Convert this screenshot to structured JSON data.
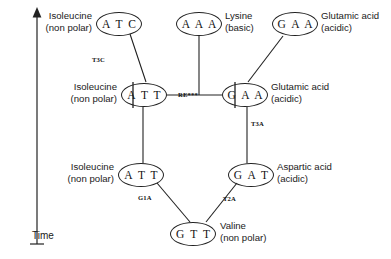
{
  "figure": {
    "axis": {
      "name": "Time",
      "direction": "upward-arrow"
    },
    "nodes": [
      {
        "id": "atc",
        "codon": "A T C",
        "amino_acid": "Isoleucine",
        "property": "(non polar)",
        "label_side": "left",
        "x": 96,
        "y": 12,
        "w": 46,
        "h": 24,
        "label_x": 18,
        "label_y": 10,
        "tick": false
      },
      {
        "id": "aaa",
        "codon": "A A A",
        "amino_acid": "Lysine",
        "property": "(basic)",
        "label_side": "right",
        "x": 176,
        "y": 12,
        "w": 46,
        "h": 24,
        "label_x": 225,
        "label_y": 10,
        "tick": false
      },
      {
        "id": "gaa_top",
        "codon": "G A A",
        "amino_acid": "Glutamic acid",
        "property": "(acidic)",
        "label_side": "right",
        "x": 272,
        "y": 12,
        "w": 46,
        "h": 24,
        "label_x": 321,
        "label_y": 10,
        "tick": false
      },
      {
        "id": "att_mid",
        "codon": "A T T",
        "amino_acid": "Isoleucine",
        "property": "(non polar)",
        "label_side": "left",
        "x": 121,
        "y": 83,
        "w": 46,
        "h": 24,
        "label_x": 43,
        "label_y": 81,
        "tick": true
      },
      {
        "id": "gaa_mid",
        "codon": "G A A",
        "amino_acid": "Glutamic acid",
        "property": "(acidic)",
        "label_side": "right",
        "x": 222,
        "y": 83,
        "w": 46,
        "h": 24,
        "label_x": 271,
        "label_y": 81,
        "tick": true
      },
      {
        "id": "att_low",
        "codon": "A T T",
        "amino_acid": "Isoleucine",
        "property": "(non polar)",
        "label_side": "left",
        "x": 118,
        "y": 163,
        "w": 46,
        "h": 24,
        "label_x": 40,
        "label_y": 161,
        "tick": false
      },
      {
        "id": "gat",
        "codon": "G A T",
        "amino_acid": "Aspartic acid",
        "property": "(acidic)",
        "label_side": "right",
        "x": 228,
        "y": 163,
        "w": 46,
        "h": 24,
        "label_x": 277,
        "label_y": 161,
        "tick": false
      },
      {
        "id": "gtt",
        "codon": "G T T",
        "amino_acid": "Valine",
        "property": "(non polar)",
        "label_side": "right",
        "x": 170,
        "y": 222,
        "w": 46,
        "h": 24,
        "label_x": 220,
        "label_y": 220,
        "tick": false
      }
    ],
    "edges": [
      {
        "id": "e-atc-att",
        "from": "atc",
        "to": "att_mid",
        "x1": 130,
        "y1": 34,
        "x2": 146,
        "y2": 82,
        "label": "T3C",
        "label_x": 92,
        "label_y": 56
      },
      {
        "id": "e-aaa-gaa",
        "from": "aaa",
        "to": "gaa_mid",
        "x1": 199,
        "y1": 36,
        "x2": 199,
        "y2": 95,
        "label": "",
        "label_x": 0,
        "label_y": 0
      },
      {
        "id": "e-att-gaa",
        "from": "att_mid",
        "to": "gaa_mid",
        "x1": 167,
        "y1": 95,
        "x2": 222,
        "y2": 95,
        "label": "RE***",
        "label_x": 178,
        "label_y": 91
      },
      {
        "id": "e-gaatop-gaamid",
        "from": "gaa_top",
        "to": "gaa_mid",
        "x1": 283,
        "y1": 36,
        "x2": 248,
        "y2": 82,
        "label": "",
        "label_x": 0,
        "label_y": 0
      },
      {
        "id": "e-att-attlow",
        "from": "att_mid",
        "to": "att_low",
        "x1": 143,
        "y1": 107,
        "x2": 143,
        "y2": 163,
        "label": "",
        "label_x": 0,
        "label_y": 0
      },
      {
        "id": "e-gaa-gat",
        "from": "gaa_mid",
        "to": "gat",
        "x1": 247,
        "y1": 107,
        "x2": 247,
        "y2": 163,
        "label": "T3A",
        "label_x": 251,
        "label_y": 120
      },
      {
        "id": "e-attlow-gtt",
        "from": "att_low",
        "to": "gtt",
        "x1": 157,
        "y1": 183,
        "x2": 190,
        "y2": 222,
        "label": "G1A",
        "label_x": 138,
        "label_y": 194
      },
      {
        "id": "e-gat-gtt",
        "from": "gat",
        "to": "gtt",
        "x1": 237,
        "y1": 183,
        "x2": 206,
        "y2": 222,
        "label": "T2A",
        "label_x": 223,
        "label_y": 195
      }
    ]
  }
}
